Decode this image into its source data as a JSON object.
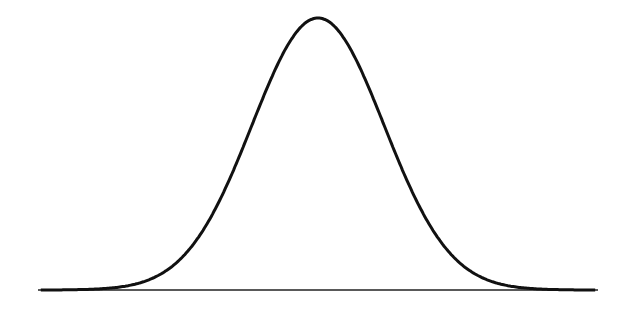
{
  "chart_data": {
    "type": "line",
    "title": "",
    "xlabel": "",
    "ylabel": "",
    "series": [
      {
        "name": "normal density",
        "mean": 0,
        "sd": 1
      }
    ],
    "x_range": [
      -4.2,
      4.2
    ],
    "grid": false,
    "legend": null,
    "colors": {
      "line": "#111111",
      "axis": "#222222",
      "background": "#ffffff"
    }
  }
}
